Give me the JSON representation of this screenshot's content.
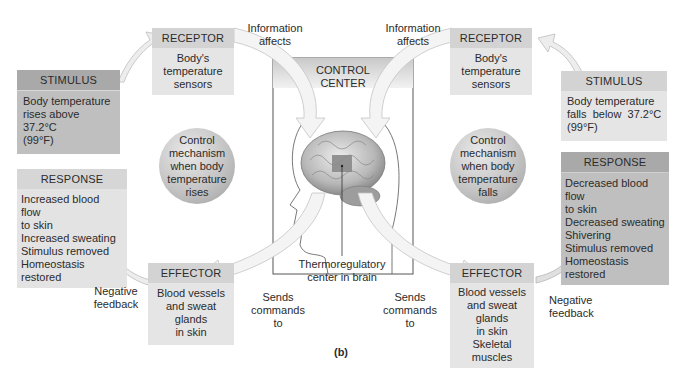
{
  "figure_label": "(b)",
  "control_center": {
    "title_line1": "CONTROL",
    "title_line2": "CENTER",
    "thermo_label_line1": "Thermoregulatory",
    "thermo_label_line2": "center in brain"
  },
  "left": {
    "stimulus": {
      "header": "STIMULUS",
      "lines": [
        "Body temperature",
        "rises above 37.2°C",
        "(99°F)"
      ]
    },
    "receptor": {
      "header": "RECEPTOR",
      "lines": [
        "Body's",
        "temperature",
        "sensors"
      ]
    },
    "control_mechanism": [
      "Control",
      "mechanism",
      "when body",
      "temperature",
      "rises"
    ],
    "response": {
      "header": "RESPONSE",
      "lines": [
        "Increased blood flow",
        "to skin",
        "Increased sweating",
        "Stimulus removed",
        "Homeostasis restored"
      ]
    },
    "effector": {
      "header": "EFFECTOR",
      "lines": [
        "Blood vessels",
        "and sweat glands",
        "in skin"
      ]
    },
    "info_label": [
      "Information",
      "affects"
    ],
    "sends_label": [
      "Sends",
      "commands",
      "to"
    ],
    "feedback_label": [
      "Negative",
      "feedback"
    ]
  },
  "right": {
    "stimulus": {
      "header": "STIMULUS",
      "lines": [
        "Body temperature",
        "falls  below  37.2°C",
        "(99°F)"
      ]
    },
    "receptor": {
      "header": "RECEPTOR",
      "lines": [
        "Body's",
        "temperature",
        "sensors"
      ]
    },
    "control_mechanism": [
      "Control",
      "mechanism",
      "when body",
      "temperature",
      "falls"
    ],
    "response": {
      "header": "RESPONSE",
      "lines": [
        "Decreased blood flow",
        "to skin",
        "Decreased sweating",
        "Shivering",
        "Stimulus removed",
        "Homeostasis restored"
      ]
    },
    "effector": {
      "header": "EFFECTOR",
      "lines": [
        "Blood vessels",
        "and sweat glands",
        "in skin",
        "Skeletal muscles"
      ]
    },
    "info_label": [
      "Information",
      "affects"
    ],
    "sends_label": [
      "Sends",
      "commands",
      "to"
    ],
    "feedback_label": [
      "Negative",
      "feedback"
    ]
  }
}
